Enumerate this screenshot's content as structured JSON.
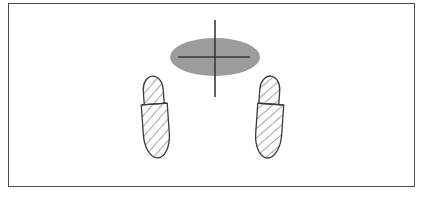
{
  "figure": {
    "title": "Foot placement diagram with body center-of-mass ellipse and crosshair",
    "background_color": "#ffffff",
    "frame": {
      "border_color": "#4a4a4a",
      "border_width": 1.5,
      "x": 8,
      "y": 3,
      "width": 407,
      "height": 184,
      "fill": "#ffffff"
    },
    "ellipse": {
      "label": "body-mass-ellipse",
      "center_x": 215,
      "center_y": 57,
      "radius_x": 45,
      "radius_y": 19,
      "fill_color": "#9c9c9c",
      "edge_color": "#9c9c9c",
      "opacity": 1
    },
    "crosshair": {
      "label": "center-crosshair",
      "color": "#3a3a3a",
      "line_width": 1.6,
      "vertical": {
        "x": 215,
        "y_top": 20,
        "y_bottom": 97
      },
      "horizontal": {
        "y": 57,
        "x_left": 178,
        "x_right": 250
      }
    },
    "feet": [
      {
        "name": "left-foot",
        "side": "left",
        "outline_color": "#3a3a3a",
        "fill_color": "#ffffff",
        "hatch_color": "#5a5a5a",
        "hatch_angle_deg": 45,
        "hatch_spacing": 7,
        "forefoot": {
          "center_x": 155,
          "center_y": 90,
          "radius_x": 10,
          "radius_y": 14
        },
        "heel": {
          "center_x": 155,
          "center_y": 130,
          "radius_x": 13,
          "radius_y": 27
        },
        "divider_y": 104,
        "rotation_deg": -4
      },
      {
        "name": "right-foot",
        "side": "right",
        "outline_color": "#3a3a3a",
        "fill_color": "#ffffff",
        "hatch_color": "#5a5a5a",
        "hatch_angle_deg": 45,
        "hatch_spacing": 7,
        "forefoot": {
          "center_x": 268,
          "center_y": 90,
          "radius_x": 10,
          "radius_y": 14
        },
        "heel": {
          "center_x": 270,
          "center_y": 130,
          "radius_x": 13,
          "radius_y": 27
        },
        "divider_y": 104,
        "rotation_deg": 4
      }
    ]
  }
}
